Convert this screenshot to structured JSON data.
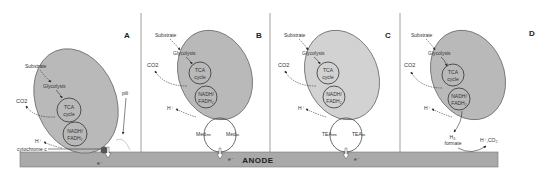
{
  "colors": {
    "cell_fill": "#b9b9b9",
    "cell_stroke": "#6e6e6e",
    "anode_fill": "#a9a9a9",
    "line": "#444444",
    "divider": "#888888"
  },
  "anode": {
    "label": "ANODE"
  },
  "panels": [
    {
      "letter": "A",
      "substrate": "Substrate",
      "glycolysis": "Glycolysis",
      "tca": [
        "TCA",
        "cycle"
      ],
      "nadh": [
        "NADH/",
        "FADH₂"
      ],
      "co2": "CO2",
      "proton": "H⁺",
      "pili": "pili",
      "cytochrome": "cytochrome c",
      "electron": "e⁻"
    },
    {
      "letter": "B",
      "substrate": "Substrate",
      "glycolysis": "Glycolysis",
      "tca": [
        "TCA",
        "cycle"
      ],
      "nadh": [
        "NADH/",
        "FADH₂"
      ],
      "co2": "CO2",
      "proton": "H⁺",
      "shuttle_left": "Medᵣₑₔ",
      "shuttle_right": "Medₒₓ",
      "electron": "e⁻"
    },
    {
      "letter": "C",
      "substrate": "Substrate",
      "glycolysis": "Glycolysis",
      "tca": [
        "TCA",
        "cycle"
      ],
      "nadh": [
        "NADH/",
        "FADH₂"
      ],
      "co2": "CO2",
      "proton": "H⁺",
      "shuttle_left": "TEAᵣₑₔ",
      "shuttle_right": "TEAₒₓ",
      "electron": "e⁻"
    },
    {
      "letter": "D",
      "substrate": "Substrate",
      "glycolysis": "Glycolysis",
      "tca": [
        "TCA",
        "cycle"
      ],
      "nadh": [
        "NADH/",
        "FADH₂"
      ],
      "co2": "CO2",
      "proton": "H⁺",
      "product_left": [
        "H₂,",
        "formate"
      ],
      "product_right": "H⁺,CO₂"
    }
  ]
}
